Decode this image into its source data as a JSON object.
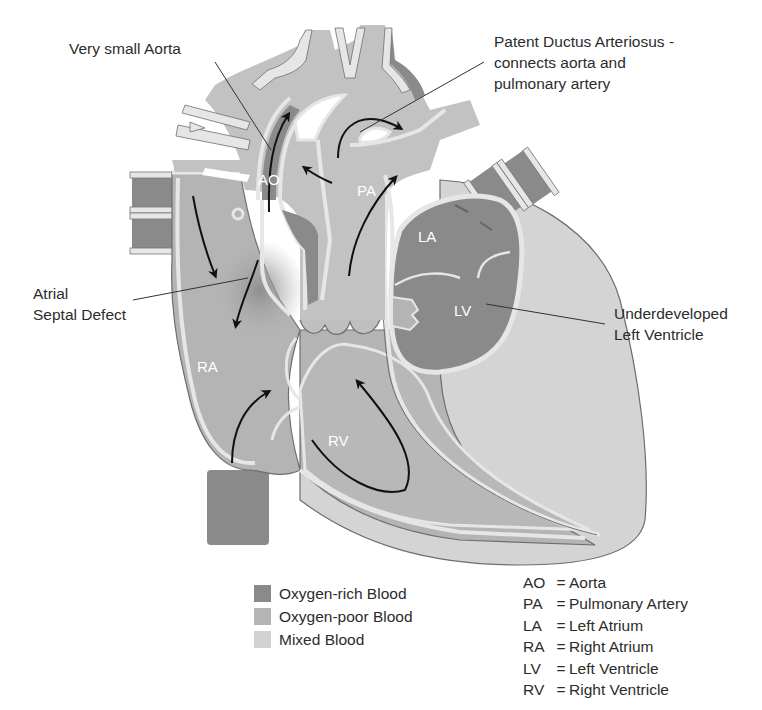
{
  "callouts": {
    "very_small_aorta": "Very small Aorta",
    "pda_line1": "Patent Ductus Arteriosus -",
    "pda_line2": "connects aorta and",
    "pda_line3": "pulmonary artery",
    "asd_line1": "Atrial",
    "asd_line2": "Septal Defect",
    "lv_line1": "Underdeveloped",
    "lv_line2": "Left Ventricle"
  },
  "chambers": {
    "ao": "AO",
    "pa": "PA",
    "la": "LA",
    "lv": "LV",
    "ra": "RA",
    "rv": "RV"
  },
  "legend": [
    {
      "label": "Oxygen-rich Blood",
      "color": "#8a8a8a"
    },
    {
      "label": "Oxygen-poor Blood",
      "color": "#b4b4b4"
    },
    {
      "label": "Mixed Blood",
      "color": "#d2d2d2"
    }
  ],
  "abbreviations": [
    {
      "code": "AO",
      "eq": "=",
      "meaning": "Aorta"
    },
    {
      "code": "PA",
      "eq": "=",
      "meaning": "Pulmonary Artery"
    },
    {
      "code": "LA",
      "eq": "=",
      "meaning": "Left Atrium"
    },
    {
      "code": "RA",
      "eq": "=",
      "meaning": "Right Atrium"
    },
    {
      "code": "LV",
      "eq": "=",
      "meaning": "Left Ventricle"
    },
    {
      "code": "RV",
      "eq": "=",
      "meaning": "Right Ventricle"
    }
  ],
  "colors": {
    "oxygen_rich": "#8a8a8a",
    "oxygen_poor": "#b4b4b4",
    "mixed": "#d2d2d2",
    "wall": "#e6e6e6",
    "outline": "#6e6e6e"
  }
}
